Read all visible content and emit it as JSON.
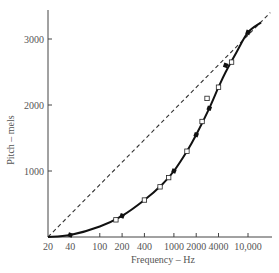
{
  "chart_data": {
    "type": "line",
    "title": "",
    "xlabel": "Frequency – Hz",
    "ylabel": "Pitch – mels",
    "x_scale": "log",
    "x_ticks": [
      20,
      40,
      100,
      200,
      400,
      1000,
      2000,
      4000,
      10000
    ],
    "x_tick_labels": [
      "20",
      "40",
      "100",
      "200",
      "400",
      "1000",
      "2000",
      "4000",
      "10,000"
    ],
    "y_ticks": [
      1000,
      2000,
      3000
    ],
    "y_tick_labels": [
      "1000",
      "2000",
      "3000"
    ],
    "ylim": [
      0,
      3400
    ],
    "xlim": [
      20,
      20000
    ],
    "grid": false,
    "legend": null,
    "series": [
      {
        "name": "Mel scale curve",
        "style": "solid",
        "x": [
          20,
          40,
          100,
          200,
          400,
          700,
          1000,
          1500,
          2000,
          3000,
          4000,
          5000,
          7000,
          10000,
          15000
        ],
        "y": [
          0,
          30,
          160,
          320,
          560,
          800,
          1000,
          1300,
          1550,
          1950,
          2270,
          2500,
          2800,
          3100,
          3250
        ]
      },
      {
        "name": "Linear reference",
        "style": "dashed",
        "x": [
          20,
          20000
        ],
        "y": [
          0,
          3400
        ]
      },
      {
        "name": "Filled markers",
        "style": "markers-filled",
        "x": [
          40,
          200,
          1000,
          2000,
          3000,
          5000,
          10000
        ],
        "y": [
          30,
          320,
          1000,
          1550,
          1950,
          2600,
          3100
        ]
      },
      {
        "name": "Open markers",
        "style": "markers-open",
        "x": [
          165,
          400,
          650,
          850,
          1500,
          2400,
          2800,
          4000,
          6000
        ],
        "y": [
          260,
          560,
          760,
          900,
          1300,
          1750,
          2100,
          2270,
          2650
        ]
      }
    ]
  }
}
